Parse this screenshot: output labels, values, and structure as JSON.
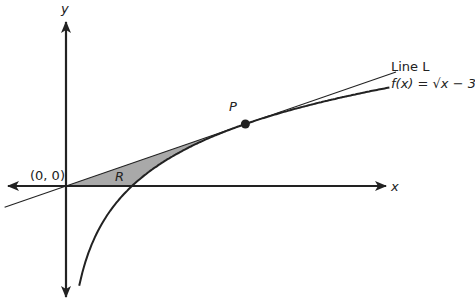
{
  "diagram": {
    "axes": {
      "x_label": "x",
      "y_label": "y"
    },
    "origin_label": "(0, 0)",
    "region_label": "R",
    "point_label": "P",
    "legend": {
      "line_label": "Line L",
      "function_label": "f(x) = √x − 3"
    },
    "colors": {
      "region_fill": "#a9a9a9",
      "stroke": "#222222"
    }
  },
  "chart_data": {
    "type": "line",
    "title": "",
    "xlabel": "x",
    "ylabel": "y",
    "xlim": [
      -0.95,
      4.95
    ],
    "ylim": [
      -1.8,
      2.7
    ],
    "series": [
      {
        "name": "f(x)",
        "model": "ln(x)",
        "x_range": [
          0.2,
          4.9
        ]
      },
      {
        "name": "Line L",
        "model": "y = x / e",
        "x_range": [
          -0.93,
          5.0
        ]
      }
    ],
    "points": [
      {
        "label": "P",
        "x": 2.718,
        "y": 1.0
      },
      {
        "label": "(0, 0)",
        "x": 0,
        "y": 0
      }
    ],
    "shaded_region": {
      "label": "R",
      "between": [
        "Line L",
        "f(x)"
      ],
      "x_range": [
        0,
        2.718
      ]
    },
    "grid": false
  }
}
